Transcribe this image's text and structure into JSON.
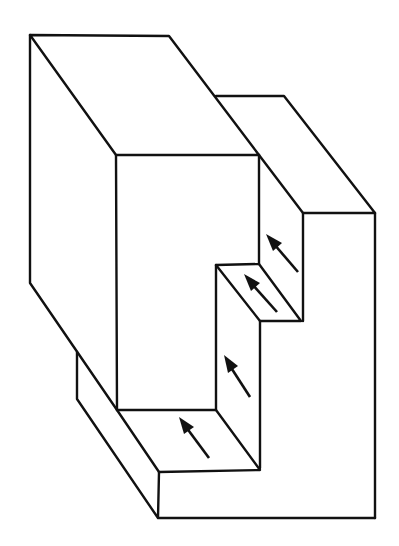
{
  "diagram": {
    "title": "",
    "stroke_color": "#111111",
    "background": "#ffffff",
    "arrows": [
      {
        "id": "arrow-upper-riser",
        "from": [
          298,
          272
        ],
        "to": [
          268,
          237
        ]
      },
      {
        "id": "arrow-middle-tread",
        "from": [
          277,
          312
        ],
        "to": [
          246,
          277
        ]
      },
      {
        "id": "arrow-lower-riser",
        "from": [
          250,
          397
        ],
        "to": [
          225,
          357
        ]
      },
      {
        "id": "arrow-bottom-tread",
        "from": [
          209,
          458
        ],
        "to": [
          180,
          418
        ]
      }
    ]
  }
}
